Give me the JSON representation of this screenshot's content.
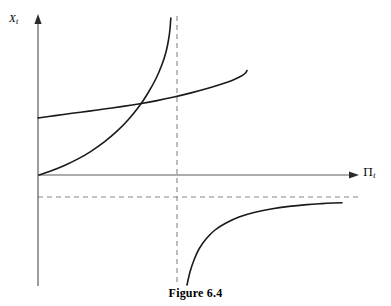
{
  "figure": {
    "caption": "Figure 6.4",
    "caption_number": "6.4",
    "caption_word": "Figure"
  },
  "axes": {
    "y_label_symbol": "X",
    "y_label_subscript": "t",
    "x_label_symbol": "Π",
    "x_label_subscript": "t",
    "x_axis_color": "#555555",
    "y_axis_color": "#555555",
    "arrow_color": "#333333",
    "origin_px": {
      "x": 38,
      "y": 175
    },
    "x_axis_end_px": {
      "x": 358,
      "y": 175
    },
    "y_axis_top_px": {
      "x": 38,
      "y": 16
    }
  },
  "asymptotes": {
    "vertical": {
      "name": "vertical-asymptote",
      "x_px": 177,
      "y_top_px": 16,
      "y_bottom_px": 286,
      "color": "#888888",
      "dash": "5 4"
    },
    "horizontal": {
      "name": "horizontal-asymptote",
      "y_px": 197,
      "x_left_px": 38,
      "x_right_px": 362,
      "color": "#888888",
      "dash": "5 4"
    }
  },
  "chart_data": {
    "type": "line",
    "title": "Figure 6.4",
    "xlabel": "Πt",
    "ylabel": "Xt",
    "grid": false,
    "legend": false,
    "axis_ranges": {
      "x_px": [
        38,
        358
      ],
      "y_px": [
        16,
        286
      ]
    },
    "annotations": [
      {
        "name": "vertical-asymptote",
        "type": "vertical-dashed-line",
        "x_px": 177
      },
      {
        "name": "horizontal-asymptote",
        "type": "horizontal-dashed-line",
        "y_px": 197
      },
      {
        "name": "curve-intersection",
        "type": "point",
        "x_px": 125,
        "y_px": 110
      }
    ],
    "series": [
      {
        "name": "gentle-rising-curve",
        "description": "Shallow concave-up curve starting on the Y axis and rising slowly to the right, crossing the vertical asymptote.",
        "stroke": "#1a1a1a",
        "stroke_width": 1.6,
        "points_px": [
          [
            38,
            118
          ],
          [
            55,
            115.6
          ],
          [
            72,
            113.3
          ],
          [
            89,
            111.1
          ],
          [
            106,
            108.8
          ],
          [
            123,
            106.4
          ],
          [
            140,
            103.7
          ],
          [
            157,
            100.6
          ],
          [
            174,
            97.0
          ],
          [
            191,
            92.9
          ],
          [
            208,
            88.3
          ],
          [
            221,
            84.3
          ],
          [
            232,
            80.4
          ],
          [
            240,
            76.8
          ],
          [
            245,
            73.5
          ],
          [
            247,
            70.5
          ]
        ]
      },
      {
        "name": "steep-exponential-curve",
        "description": "Convex curve rising from the origin and shooting up asymptotically toward the vertical dashed line.",
        "stroke": "#1a1a1a",
        "stroke_width": 1.6,
        "points_px": [
          [
            39,
            175
          ],
          [
            52,
            170.5
          ],
          [
            65,
            165.2
          ],
          [
            78,
            158.9
          ],
          [
            91,
            151.3
          ],
          [
            104,
            142.2
          ],
          [
            117,
            131.2
          ],
          [
            128,
            120.0
          ],
          [
            139,
            106.5
          ],
          [
            148,
            93.0
          ],
          [
            156,
            78.5
          ],
          [
            162,
            64.5
          ],
          [
            166,
            52.0
          ],
          [
            168.5,
            40.0
          ],
          [
            170,
            29.0
          ],
          [
            170.8,
            18.0
          ]
        ]
      },
      {
        "name": "lower-right-hyperbola-branch",
        "description": "Branch below the horizontal asymptote, rising from the bottom near the vertical asymptote and flattening toward the horizontal asymptote on the right.",
        "stroke": "#1a1a1a",
        "stroke_width": 1.6,
        "points_px": [
          [
            187,
            285
          ],
          [
            190,
            272
          ],
          [
            194,
            260
          ],
          [
            199,
            249
          ],
          [
            206,
            239
          ],
          [
            215,
            230
          ],
          [
            226,
            223
          ],
          [
            239,
            217
          ],
          [
            254,
            212.5
          ],
          [
            271,
            209
          ],
          [
            289,
            206.4
          ],
          [
            307,
            204.6
          ],
          [
            322,
            203.6
          ],
          [
            334,
            203.0
          ],
          [
            342,
            202.7
          ]
        ]
      }
    ]
  }
}
